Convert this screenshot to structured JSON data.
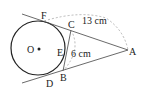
{
  "diagram": {
    "type": "geometry",
    "points": {
      "O": "O",
      "F": "F",
      "C": "C",
      "E": "E",
      "B": "B",
      "D": "D",
      "A": "A"
    },
    "measurements": {
      "AF": "13 cm",
      "BC": "6 cm"
    },
    "colors": {
      "stroke": "#222222",
      "dashed": "#999999"
    }
  }
}
